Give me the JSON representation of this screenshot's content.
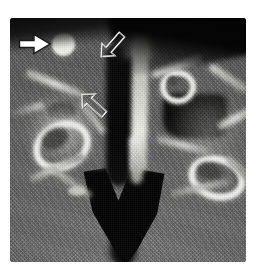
{
  "figure": {
    "title": "Axial cone-beam CT slice of the anterior maxilla and nasal cavity",
    "modality": "CT",
    "orientation": "axial",
    "colormap": "grayscale",
    "frame": {
      "x": 10,
      "y": 18,
      "width": 236,
      "height": 244,
      "border_radius_px": 3,
      "background_color": "#6a6a6a"
    },
    "page_background_color": "#ffffff"
  },
  "image_regions": [
    {
      "name": "air-band-superior",
      "label": "Superior air / out-of-field band",
      "intensity": "very low (black)",
      "color": "#050505"
    },
    {
      "name": "soft-tissue-field",
      "label": "Soft tissue background with diagonal reconstruction moire",
      "intensity": "mid gray",
      "color": "#6e6e6e"
    },
    {
      "name": "calcified-nodule",
      "label": "Round hyperdense calcified nodule",
      "intensity": "very high (bright white)",
      "color": "#f6f6f2",
      "center_px": [
        53,
        26
      ],
      "radius_px": 11
    },
    {
      "name": "nasal-septum",
      "label": "Midline nasal septum, vertical hyperdense strip",
      "intensity": "high",
      "color": "#d8d8d4"
    },
    {
      "name": "nasal-airway-left",
      "label": "Left nasal airway, dark vertical channel",
      "intensity": "very low (black)",
      "color": "#060606"
    },
    {
      "name": "maxillary-sinus-air-right",
      "label": "Right maxillary / nasal air cavity, large dark rectangle",
      "intensity": "very low (black)",
      "color": "#030303"
    },
    {
      "name": "bright-ring-left",
      "label": "Left oval hyperdense cortical ring (root canal cross-section)",
      "intensity": "high",
      "color": "#f2f2ee"
    },
    {
      "name": "bright-ring-right-upper",
      "label": "Right upper small hyperdense ring",
      "intensity": "high",
      "color": "#f0f0ec"
    },
    {
      "name": "bright-ring-right-lower",
      "label": "Right lower oval hyperdense ring",
      "intensity": "high",
      "color": "#f2f2ee"
    },
    {
      "name": "airway-inferior-v",
      "label": "Inferior V-shaped dark airway / palatal air space",
      "intensity": "very low (black)",
      "color": "#040404"
    },
    {
      "name": "trabecular-struts",
      "label": "Radiating trabecular bone struts",
      "intensity": "moderately high",
      "color": "#bdbdb8"
    }
  ],
  "annotations": [
    {
      "name": "arrow-solid-white-right",
      "icon": "arrow-right-solid-icon",
      "style": "solid filled white arrow with thin dark outline",
      "direction": "right",
      "points_at": "calcified-nodule",
      "fill_color": "#ffffff",
      "stroke_color": "#1c1c1c",
      "position_px": [
        18,
        32
      ]
    },
    {
      "name": "arrow-outline-down-left",
      "icon": "arrow-down-left-outline-icon",
      "style": "hollow line-drawn arrow outline",
      "direction": "down-left",
      "points_at": "nasal-septum",
      "fill_color": "none",
      "stroke_color": "#f2f2f2",
      "position_px": [
        99,
        29
      ]
    },
    {
      "name": "arrow-outline-up-left",
      "icon": "arrow-up-left-outline-icon",
      "style": "hollow line-drawn arrow outline",
      "direction": "up-left",
      "points_at": "bright-ring-left",
      "fill_color": "none",
      "stroke_color": "#efefef",
      "position_px": [
        80,
        92
      ]
    }
  ]
}
